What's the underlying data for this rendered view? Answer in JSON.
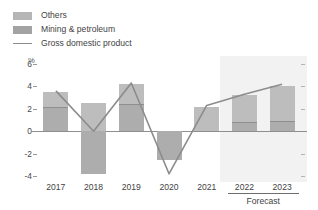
{
  "legend": {
    "items": [
      {
        "label": "Others",
        "swatch": "bar-others-swatch",
        "color": "#bdbdbd"
      },
      {
        "label": "Mining & petroleum",
        "swatch": "bar-mining-swatch",
        "color": "#adadad"
      },
      {
        "label": "Gross domestic product",
        "swatch": "gdp-line-swatch",
        "color": "#8c8c8c"
      }
    ]
  },
  "axis": {
    "y_unit": "%",
    "y_ticks": [
      "6",
      "4",
      "2",
      "0",
      "-2",
      "-4"
    ],
    "x_labels": [
      "2017",
      "2018",
      "2019",
      "2020",
      "2021",
      "2022",
      "2023"
    ],
    "forecast_label": "Forecast"
  },
  "chart_data": {
    "type": "bar",
    "title": "",
    "subtitle": "",
    "xlabel": "",
    "ylabel": "%",
    "ylim": [
      -4,
      6
    ],
    "yticks": [
      -4,
      -2,
      0,
      2,
      4,
      6
    ],
    "grid": false,
    "legend_position": "top-left",
    "categories": [
      "2017",
      "2018",
      "2019",
      "2020",
      "2021",
      "2022",
      "2023"
    ],
    "stacked": true,
    "series": [
      {
        "name": "Mining & petroleum",
        "type": "bar",
        "color": "#adadad",
        "values": [
          2.2,
          -3.8,
          2.4,
          -2.6,
          0.0,
          0.8,
          0.9
        ]
      },
      {
        "name": "Others",
        "type": "bar",
        "color": "#bdbdbd",
        "values": [
          1.3,
          2.5,
          1.8,
          0.0,
          2.2,
          2.4,
          3.1
        ]
      },
      {
        "name": "Gross domestic product",
        "type": "line",
        "color": "#8c8c8c",
        "values": [
          3.6,
          0.0,
          4.3,
          -3.8,
          2.3,
          3.3,
          4.2
        ]
      }
    ],
    "annotations": [
      {
        "text": "Forecast",
        "from": "2022",
        "to": "2023",
        "position": "below-axis"
      }
    ]
  },
  "colors": {
    "others": "#bdbdbd",
    "mining": "#adadad",
    "gdp_line": "#8c8c8c",
    "forecast_band": "#f2f2f2",
    "axis": "#8f8f8f",
    "text": "#3f3f3f"
  }
}
